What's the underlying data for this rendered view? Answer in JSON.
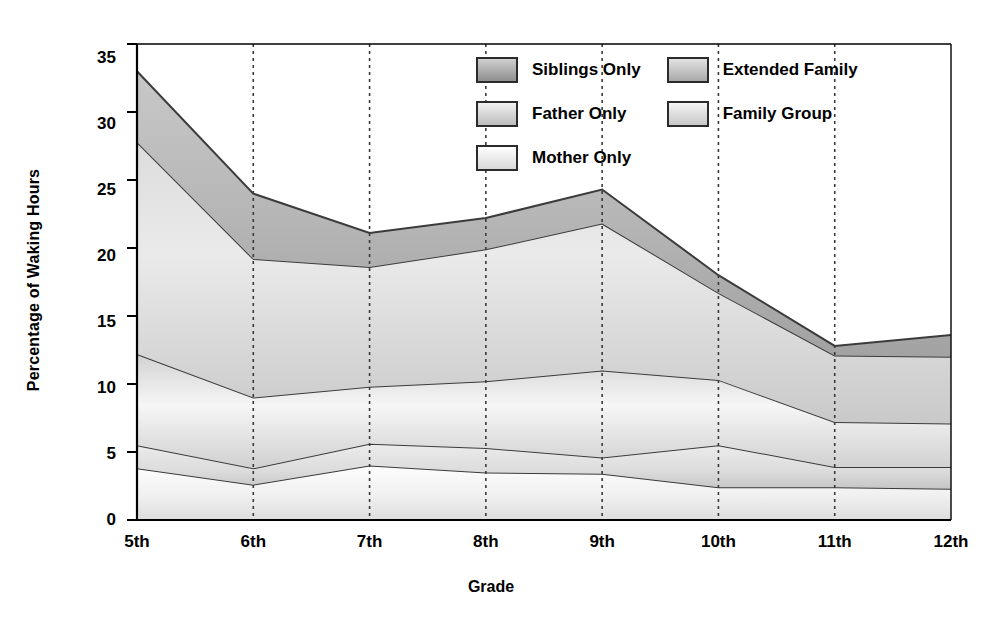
{
  "chart_data": {
    "type": "area",
    "title": "",
    "xlabel": "Grade",
    "ylabel": "Percentage of Waking Hours",
    "categories": [
      "5th",
      "6th",
      "7th",
      "8th",
      "9th",
      "10th",
      "11th",
      "12th"
    ],
    "xtick_labels": [
      "5th",
      "6th",
      "7th",
      "8th",
      "9th",
      "10th",
      "11th",
      "12th"
    ],
    "ytick_labels": [
      "0",
      "5",
      "10",
      "15",
      "20",
      "25",
      "30",
      "35"
    ],
    "ytick_values": [
      0,
      5,
      10,
      15,
      20,
      25,
      30,
      35
    ],
    "ylim": [
      0,
      35
    ],
    "grid": "vertical-dashed",
    "stacked": true,
    "legend_position": "inside-top-right",
    "series": [
      {
        "name": "Mother Only",
        "color": "#f2f2f2",
        "gradient_from": "#fcfcfc",
        "gradient_to": "#e2e2e2",
        "values": [
          3.8,
          2.6,
          4.0,
          3.5,
          3.4,
          2.4,
          2.4,
          2.3
        ]
      },
      {
        "name": "Father Only",
        "color": "#d8d8d8",
        "gradient_from": "#eaeaea",
        "gradient_to": "#c9c9c9",
        "values": [
          1.7,
          1.2,
          1.6,
          1.8,
          1.2,
          3.1,
          1.5,
          1.6
        ]
      },
      {
        "name": "Family Group",
        "color": "#e8e8e8",
        "gradient_from": "#fafafa",
        "gradient_to": "#d5d5d5",
        "values": [
          6.7,
          5.2,
          4.2,
          4.9,
          6.4,
          4.8,
          3.3,
          3.2
        ]
      },
      {
        "name": "Extended Family",
        "color": "#c4c4c4",
        "gradient_from": "#d9d9d9",
        "gradient_to": "#b6b6b6",
        "values": [
          15.6,
          10.2,
          8.8,
          9.7,
          10.8,
          6.4,
          4.9,
          4.9
        ]
      },
      {
        "name": "Siblings Only",
        "color": "#a8a8a8",
        "gradient_from": "#c0c0c0",
        "gradient_to": "#9a9a9a",
        "values": [
          5.2,
          4.8,
          2.5,
          2.3,
          2.5,
          1.3,
          0.7,
          1.6
        ]
      }
    ],
    "cumulative_tops": {
      "mother_only": [
        3.8,
        2.6,
        4.0,
        3.5,
        3.4,
        2.4,
        2.4,
        2.3
      ],
      "father_only": [
        5.5,
        3.8,
        5.6,
        5.3,
        4.6,
        5.5,
        3.9,
        3.9
      ],
      "family_group": [
        12.2,
        9.0,
        9.8,
        10.2,
        11.0,
        10.3,
        7.2,
        7.1
      ],
      "extended_family": [
        27.8,
        19.2,
        18.6,
        19.9,
        21.8,
        16.7,
        12.1,
        12.0
      ],
      "siblings_only": [
        33.0,
        24.0,
        21.1,
        22.2,
        24.3,
        18.0,
        12.8,
        13.6
      ]
    }
  },
  "legend": {
    "column_left": [
      {
        "label": "Siblings Only",
        "swatch": "siblings-only-swatch"
      },
      {
        "label": "Father Only",
        "swatch": "father-only-swatch"
      },
      {
        "label": "Mother Only",
        "swatch": "mother-only-swatch"
      }
    ],
    "column_right": [
      {
        "label": "Extended Family",
        "swatch": "extended-family-swatch"
      },
      {
        "label": "Family Group",
        "swatch": "family-group-swatch"
      }
    ]
  },
  "colors": {
    "axis": "#000000",
    "gridline": "#3a3a3a",
    "band_outline": "#3b3b3b",
    "background": "#ffffff"
  }
}
